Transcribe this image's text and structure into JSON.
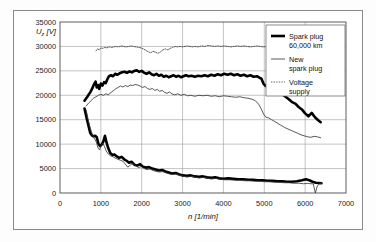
{
  "figure": {
    "background": "#fdfdfd",
    "frame_color": "#8a8a8a",
    "plot_bg": "#ffffff"
  },
  "chart_data": {
    "type": "line",
    "title": "",
    "subtitle": "",
    "xlabel": "n [1/min]",
    "ylabel": "U_z [V]",
    "ylabel_display": "U",
    "ylabel_sub": "z",
    "ylabel_unit": " [V]",
    "xlim": [
      0,
      7000
    ],
    "ylim": [
      0,
      35000
    ],
    "xticks": [
      0,
      1000,
      2000,
      3000,
      4000,
      5000,
      6000,
      7000
    ],
    "yticks": [
      0,
      5000,
      10000,
      15000,
      20000,
      25000,
      30000,
      35000
    ],
    "xtick_labels": [
      "0",
      "1000",
      "2000",
      "3000",
      "4000",
      "5000",
      "6000",
      "7000"
    ],
    "ytick_labels": [
      "0",
      "5000",
      "10000",
      "15000",
      "20000",
      "25000",
      "30000",
      "35000"
    ],
    "grid": true,
    "grid_color": "#9a9a9a",
    "legend_position": "top-right",
    "legend": [
      {
        "label_line1": "Spark plug",
        "label_line2": "60,000 km",
        "style": "thick-solid",
        "color": "#000000",
        "width": 2.6,
        "dash": ""
      },
      {
        "label_line1": "New",
        "label_line2": "spark plug",
        "style": "thin-solid",
        "color": "#3a3a3a",
        "width": 0.85,
        "dash": ""
      },
      {
        "label_line1": "Voltage",
        "label_line2": "supply",
        "style": "dotted",
        "color": "#3a3a3a",
        "width": 0.8,
        "dash": "1.4,1.2"
      }
    ],
    "series": [
      {
        "name": "Spark plug 60,000 km (upper branch)",
        "style": "thick-solid",
        "color": "#000000",
        "width": 2.6,
        "dash": "",
        "x": [
          600,
          660,
          700,
          740,
          790,
          830,
          870,
          900,
          930,
          960,
          1000,
          1040,
          1080,
          1120,
          1160,
          1200,
          1250,
          1300,
          1350,
          1400,
          1460,
          1520,
          1580,
          1640,
          1700,
          1760,
          1820,
          1880,
          1940,
          2000,
          2060,
          2120,
          2180,
          2240,
          2300,
          2360,
          2420,
          2480,
          2540,
          2600,
          2660,
          2720,
          2780,
          2840,
          2900,
          2960,
          3020,
          3080,
          3150,
          3220,
          3300,
          3380,
          3460,
          3540,
          3620,
          3700,
          3780,
          3860,
          3940,
          4020,
          4100,
          4180,
          4260,
          4340,
          4420,
          4500,
          4580,
          4660,
          4740,
          4820,
          4880,
          4930,
          4980,
          5030,
          5080,
          5140,
          5200,
          5280,
          5360,
          5440,
          5520,
          5600,
          5680,
          5760,
          5840,
          5920,
          6000,
          6080,
          6160,
          6240,
          6320,
          6380
        ],
        "y": [
          18900,
          19600,
          20100,
          20600,
          21400,
          22200,
          22800,
          21600,
          22100,
          21300,
          22400,
          22000,
          22700,
          22500,
          23300,
          23900,
          24100,
          23900,
          24400,
          24200,
          24500,
          24700,
          24800,
          24600,
          24900,
          24700,
          25000,
          25100,
          24800,
          25000,
          24600,
          24400,
          24700,
          24300,
          24100,
          24400,
          24000,
          24200,
          23800,
          24000,
          23700,
          23900,
          24100,
          23800,
          24000,
          23700,
          23900,
          24100,
          23900,
          24000,
          23800,
          24000,
          23900,
          24100,
          23900,
          24200,
          24000,
          24300,
          24100,
          24400,
          24200,
          24400,
          24100,
          24300,
          24000,
          24200,
          23900,
          24100,
          23800,
          23900,
          23600,
          23400,
          22400,
          21900,
          22200,
          21400,
          21600,
          21000,
          20700,
          20200,
          19700,
          19200,
          18600,
          18300,
          17600,
          17100,
          16300,
          15700,
          16400,
          15500,
          14900,
          14500
        ]
      },
      {
        "name": "Spark plug 60,000 km (lower branch)",
        "style": "thick-solid",
        "color": "#000000",
        "width": 2.6,
        "dash": "",
        "x": [
          600,
          650,
          700,
          740,
          780,
          820,
          860,
          900,
          940,
          980,
          1020,
          1060,
          1100,
          1140,
          1180,
          1230,
          1280,
          1330,
          1390,
          1450,
          1510,
          1570,
          1630,
          1690,
          1750,
          1820,
          1890,
          1960,
          2030,
          2100,
          2180,
          2260,
          2340,
          2420,
          2500,
          2580,
          2660,
          2740,
          2830,
          2920,
          3010,
          3100,
          3200,
          3300,
          3400,
          3500,
          3600,
          3700,
          3800,
          3900,
          4000,
          4120,
          4240,
          4360,
          4480,
          4600,
          4720,
          4840,
          4960,
          5080,
          5200,
          5320,
          5440,
          5560,
          5680,
          5800,
          5920,
          6020,
          6100,
          6180,
          6260,
          6340,
          6400
        ],
        "y": [
          17300,
          15400,
          13700,
          12300,
          11800,
          11600,
          11700,
          11400,
          10100,
          9600,
          9900,
          10500,
          11700,
          10300,
          9200,
          8200,
          7800,
          7900,
          7500,
          7200,
          7400,
          6900,
          6600,
          6200,
          6400,
          5800,
          5600,
          5900,
          5400,
          5200,
          5300,
          5000,
          4800,
          4600,
          4700,
          4400,
          4200,
          4000,
          4100,
          3800,
          3600,
          3500,
          3600,
          3400,
          3300,
          3400,
          3200,
          3100,
          3200,
          3000,
          2900,
          3000,
          2900,
          2800,
          2800,
          2700,
          2700,
          2600,
          2600,
          2500,
          2500,
          2400,
          2400,
          2300,
          2300,
          2400,
          2600,
          2800,
          2600,
          2300,
          2100,
          2050,
          2000
        ]
      },
      {
        "name": "New spark plug (upper branch)",
        "style": "thin-solid",
        "color": "#3a3a3a",
        "width": 0.85,
        "dash": "",
        "x": [
          640,
          700,
          760,
          820,
          880,
          940,
          1000,
          1060,
          1120,
          1180,
          1240,
          1300,
          1360,
          1420,
          1480,
          1540,
          1600,
          1660,
          1720,
          1780,
          1840,
          1900,
          1960,
          2020,
          2080,
          2140,
          2200,
          2260,
          2320,
          2380,
          2440,
          2500,
          2560,
          2620,
          2680,
          2740,
          2800,
          2880,
          2960,
          3040,
          3120,
          3200,
          3300,
          3400,
          3500,
          3600,
          3700,
          3800,
          3900,
          4000,
          4100,
          4200,
          4300,
          4400,
          4500,
          4600,
          4700,
          4780,
          4860,
          4920,
          4980,
          5040,
          5100,
          5180,
          5260,
          5340,
          5420,
          5500,
          5580,
          5660,
          5740,
          5820,
          5900,
          5980,
          6060,
          6140,
          6220,
          6300,
          6380
        ],
        "y": [
          17800,
          18400,
          18900,
          19400,
          19700,
          20000,
          20200,
          20000,
          20300,
          20100,
          20500,
          20900,
          21300,
          21600,
          21900,
          21700,
          22000,
          21800,
          22100,
          22000,
          22200,
          22100,
          21900,
          21600,
          21800,
          21400,
          21200,
          21400,
          21000,
          21200,
          20800,
          21000,
          20600,
          20400,
          20700,
          20300,
          20100,
          20300,
          20000,
          20200,
          19900,
          20000,
          19800,
          20000,
          19900,
          20000,
          19800,
          19900,
          19700,
          19900,
          19800,
          19700,
          19600,
          19700,
          19500,
          19400,
          19200,
          18900,
          18200,
          17300,
          16200,
          15500,
          15400,
          15000,
          14600,
          14200,
          13800,
          13400,
          13100,
          12800,
          12500,
          12200,
          11900,
          11700,
          11500,
          11400,
          11600,
          11500,
          11300
        ]
      },
      {
        "name": "New spark plug (lower branch)",
        "style": "thin-solid",
        "color": "#3a3a3a",
        "width": 0.85,
        "dash": "",
        "x": [
          640,
          690,
          740,
          790,
          840,
          890,
          930,
          970,
          1010,
          1050,
          1090,
          1130,
          1180,
          1240,
          1300,
          1360,
          1420,
          1480,
          1540,
          1600,
          1660,
          1720,
          1780,
          1850,
          1920,
          1990,
          2060,
          2130,
          2200,
          2280,
          2360,
          2440,
          2520,
          2600,
          2680,
          2760,
          2850,
          2940,
          3030,
          3120,
          3220,
          3320,
          3420,
          3520,
          3620,
          3720,
          3820,
          3920,
          4040,
          4160,
          4280,
          4400,
          4520,
          4640,
          4760,
          4880,
          5000,
          5120,
          5240,
          5360,
          5480,
          5600,
          5720,
          5840,
          5960,
          6060,
          6140,
          6200,
          6250,
          6300,
          6360,
          6400
        ],
        "y": [
          17000,
          15000,
          13300,
          12000,
          11200,
          10400,
          9200,
          8800,
          9800,
          10200,
          9500,
          8600,
          8000,
          7600,
          7400,
          7100,
          6900,
          6700,
          6500,
          5900,
          5300,
          5700,
          6100,
          5600,
          5200,
          5400,
          5000,
          4800,
          4900,
          4600,
          4400,
          4300,
          4400,
          4100,
          3900,
          3800,
          3900,
          3600,
          3400,
          3300,
          3400,
          3200,
          3100,
          3200,
          3000,
          2900,
          3000,
          2800,
          2700,
          2700,
          2600,
          2600,
          2500,
          2500,
          2400,
          2400,
          2300,
          2300,
          2200,
          2200,
          2100,
          2100,
          2000,
          2000,
          1900,
          1950,
          1900,
          1850,
          0,
          1500,
          1900,
          1950
        ]
      },
      {
        "name": "Voltage supply",
        "style": "dotted",
        "color": "#3a3a3a",
        "width": 0.8,
        "dash": "1.4,1.2",
        "x": [
          880,
          920,
          960,
          1000,
          1050,
          1100,
          1150,
          1200,
          1260,
          1320,
          1380,
          1440,
          1500,
          1560,
          1620,
          1680,
          1740,
          1800,
          1860,
          1920,
          1980,
          2040,
          2100,
          2160,
          2220,
          2280,
          2340,
          2400,
          2460,
          2520,
          2580,
          2640,
          2700,
          2760,
          2820,
          2880,
          2940,
          3000,
          3060,
          3120,
          3180,
          3240,
          3300,
          3380,
          3460,
          3540,
          3620,
          3700,
          3780,
          3860,
          3940,
          4020,
          4100,
          4180,
          4260,
          4340,
          4420,
          4500,
          4580,
          4660,
          4740,
          4820,
          4900,
          4980,
          5060,
          5140,
          5220,
          5300,
          5380,
          5460,
          5540,
          5620,
          5700,
          5780,
          5860,
          5940,
          6020,
          6100,
          6180,
          6260,
          6340,
          6400
        ],
        "y": [
          29100,
          29500,
          29300,
          29700,
          29600,
          29800,
          29700,
          29900,
          29800,
          29900,
          30000,
          29900,
          30100,
          30000,
          29900,
          30000,
          30100,
          30000,
          29900,
          29800,
          29700,
          29500,
          29200,
          28900,
          28700,
          29000,
          28800,
          28600,
          28900,
          29300,
          29500,
          29300,
          29600,
          29800,
          30000,
          29900,
          30000,
          29900,
          30000,
          30100,
          30000,
          29900,
          30000,
          29900,
          30100,
          30000,
          30200,
          30100,
          30000,
          30100,
          30000,
          30100,
          30000,
          29900,
          30000,
          30100,
          30000,
          30100,
          30000,
          29900,
          30000,
          30100,
          30000,
          29900,
          30000,
          30100,
          30000,
          30100,
          30200,
          30100,
          30000,
          29900,
          29800,
          29900,
          29800,
          29700,
          29800,
          29700,
          29800,
          29700,
          29800,
          29700
        ]
      }
    ]
  }
}
